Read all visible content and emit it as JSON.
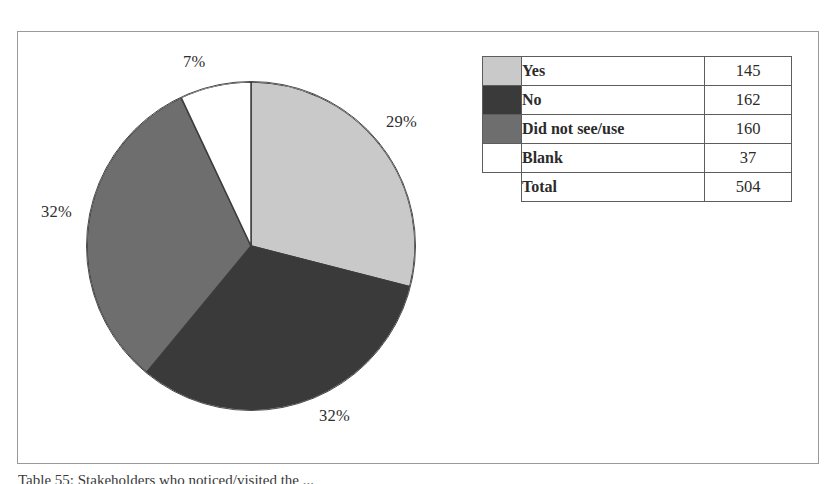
{
  "figure": {
    "caption": "Table 55: Stakeholders who noticed/visited the ..."
  },
  "chart_data": {
    "type": "pie",
    "title": "",
    "categories": [
      "Yes",
      "No",
      "Did not see/use",
      "Blank"
    ],
    "values": [
      145,
      162,
      160,
      37
    ],
    "percent_labels": [
      "29%",
      "32%",
      "32%",
      "7%"
    ],
    "percents": [
      29,
      32,
      32,
      7
    ],
    "total": 504,
    "colors": [
      "#c9c9c9",
      "#3a3a3a",
      "#6e6e6e",
      "#ffffff"
    ],
    "start_angle_deg": 0,
    "direction": "clockwise",
    "legend_position": "right",
    "grid": false
  },
  "labels": {
    "blank_pct": "7%",
    "yes_pct": "29%",
    "did_not_see_use_pct": "32%",
    "no_pct": "32%"
  },
  "legend_table": {
    "rows": [
      {
        "label": "Yes",
        "value": "145",
        "swatch": "#c9c9c9",
        "has_swatch": true
      },
      {
        "label": "No",
        "value": "162",
        "swatch": "#3a3a3a",
        "has_swatch": true
      },
      {
        "label": "Did not see/use",
        "value": "160",
        "swatch": "#6e6e6e",
        "has_swatch": true
      },
      {
        "label": "Blank",
        "value": "37",
        "swatch": "#ffffff",
        "has_swatch": true
      },
      {
        "label": "Total",
        "value": "504",
        "swatch": "",
        "has_swatch": false
      }
    ]
  }
}
